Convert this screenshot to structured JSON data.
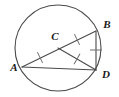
{
  "figure": {
    "kind": "circle-geometry-diagram",
    "width": 119,
    "height": 97,
    "background_color": "#ffffff",
    "stroke_color": "#4a4a4a",
    "label_color": "#1a1a1a",
    "tick_color": "#6e6e6e"
  },
  "circle": {
    "name": "circle-C",
    "center_x": 58,
    "center_y": 48,
    "radius": 43,
    "stroke_color": "#4a4a4a",
    "stroke_width": 1
  },
  "points": [
    {
      "id": "A",
      "label": "A",
      "x": 22,
      "y": 67,
      "label_x": 14,
      "label_y": 71
    },
    {
      "id": "B",
      "label": "B",
      "x": 96,
      "y": 31,
      "label_x": 103,
      "label_y": 28
    },
    {
      "id": "C",
      "label": "C",
      "x": 58,
      "y": 48,
      "label_x": 53,
      "label_y": 40
    },
    {
      "id": "D",
      "label": "D",
      "x": 96,
      "y": 70,
      "label_x": 102,
      "label_y": 77
    }
  ],
  "segments": [
    {
      "id": "AB",
      "from": "A",
      "to": "B",
      "x1": 22,
      "y1": 67,
      "x2": 96,
      "y2": 31,
      "role": "diameter"
    },
    {
      "id": "AD",
      "from": "A",
      "to": "D",
      "x1": 22,
      "y1": 67,
      "x2": 96,
      "y2": 70,
      "role": "chord"
    },
    {
      "id": "CD",
      "from": "C",
      "to": "D",
      "x1": 58,
      "y1": 48,
      "x2": 96,
      "y2": 70,
      "role": "radius"
    },
    {
      "id": "BD",
      "from": "B",
      "to": "D",
      "x1": 96,
      "y1": 31,
      "x2": 96,
      "y2": 70,
      "role": "chord"
    }
  ],
  "tick_marks": [
    {
      "id": "tick-AC",
      "on_segment": "AC",
      "count": 1,
      "x": 40,
      "y": 57.5,
      "angle": -26
    },
    {
      "id": "tick-CB",
      "on_segment": "CB",
      "count": 1,
      "x": 77,
      "y": 39.5,
      "angle": -26
    },
    {
      "id": "tick-CD",
      "on_segment": "CD",
      "count": 1,
      "x": 77,
      "y": 59,
      "angle": 30
    },
    {
      "id": "tick-BD",
      "on_segment": "BD",
      "count": 1,
      "x": 96,
      "y": 50,
      "angle": 90
    }
  ],
  "notes": {
    "equal_marks_meaning": "single tick marks indicate congruent radii CA, CB, CD",
    "diameter": "AB passes through center C"
  }
}
